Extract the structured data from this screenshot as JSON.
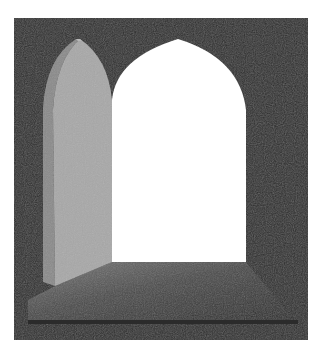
{
  "scene": {
    "title": "Open arched doorway",
    "description": "Illustration of an open arched door: dark textured wall frame, a grey arched door swung open on the left, a bright white arched opening, and a shaded floor threshold.",
    "colors": {
      "background": "#ffffff",
      "wall": "#2f2f2f",
      "wall_texture": "#3a3a3a",
      "door_front": "#a8a8a8",
      "door_side": "#8a8a8a",
      "opening": "#ffffff",
      "floor_light": "#6e6e6e",
      "floor_dark": "#262626",
      "floor_band": "#2b2b2b"
    }
  }
}
